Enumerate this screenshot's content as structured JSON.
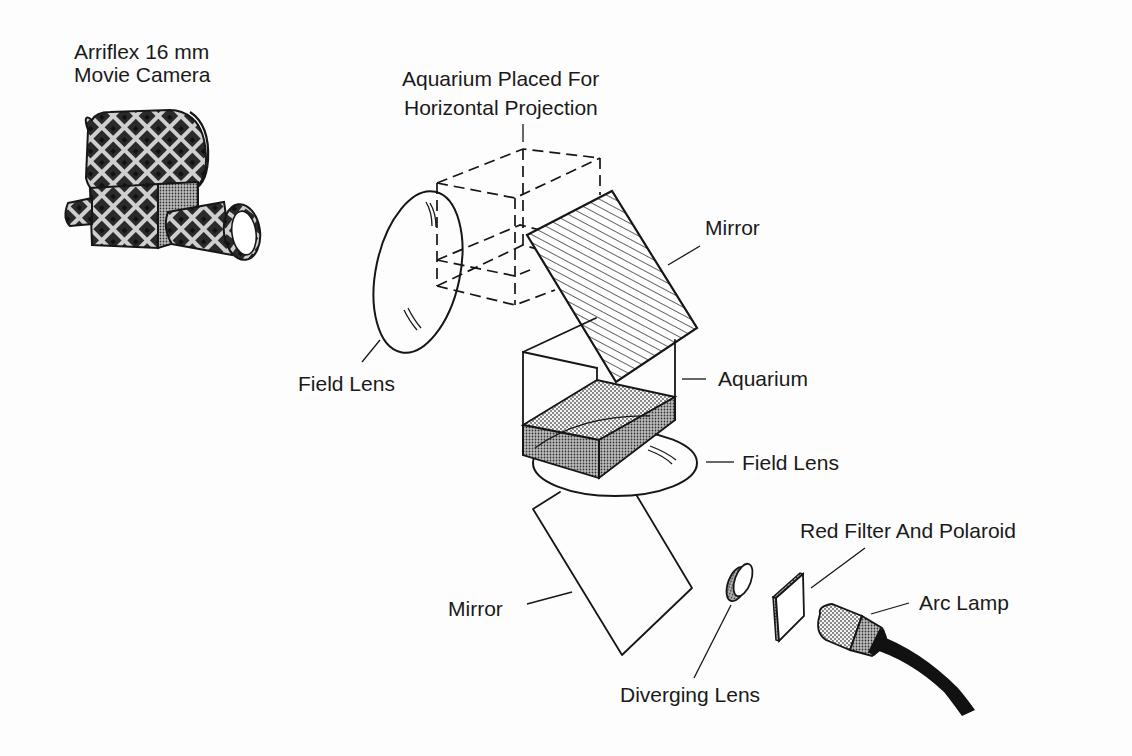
{
  "diagram": {
    "type": "optical-setup",
    "colors": {
      "ink": "#161616",
      "paper": "#fdfdfd",
      "stipple": "#9a9a9a"
    },
    "labels": {
      "camera_line1": "Arriflex 16 mm",
      "camera_line2": "Movie Camera",
      "aquarium_horizontal_line1": "Aquarium Placed For",
      "aquarium_horizontal_line2": "Horizontal Projection",
      "mirror_upper": "Mirror",
      "field_lens_left": "Field Lens",
      "aquarium": "Aquarium",
      "field_lens_lower": "Field Lens",
      "red_filter": "Red Filter And Polaroid",
      "arc_lamp": "Arc Lamp",
      "mirror_lower": "Mirror",
      "diverging_lens": "Diverging Lens"
    },
    "components": [
      {
        "id": "camera",
        "icon": "movie-camera-icon"
      },
      {
        "id": "aquarium-horizontal",
        "style": "dashed-box"
      },
      {
        "id": "field-lens-left",
        "icon": "lens-icon"
      },
      {
        "id": "mirror-upper",
        "style": "hatched-plane"
      },
      {
        "id": "aquarium",
        "style": "box-with-stippled-water"
      },
      {
        "id": "field-lens-lower",
        "icon": "lens-icon"
      },
      {
        "id": "mirror-lower",
        "style": "plain-plane"
      },
      {
        "id": "diverging-lens",
        "icon": "lens-icon"
      },
      {
        "id": "red-filter-polaroid",
        "icon": "filter-icon"
      },
      {
        "id": "arc-lamp",
        "icon": "lamp-icon"
      }
    ]
  }
}
